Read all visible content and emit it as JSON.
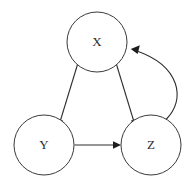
{
  "diagram": {
    "type": "directed-graph",
    "title": "",
    "background_color": "#ffffff",
    "node_stroke_color": "#3a3a3a",
    "edge_color": "#2e2e2e",
    "label_color": "#2b2b2b",
    "nodes": [
      {
        "id": "X",
        "label": "X",
        "cx": 97,
        "cy": 42,
        "r": 30
      },
      {
        "id": "Y",
        "label": "Y",
        "cx": 44,
        "cy": 145,
        "r": 30
      },
      {
        "id": "Z",
        "label": "Z",
        "cx": 151,
        "cy": 145,
        "r": 30
      }
    ],
    "edges": [
      {
        "id": "x-to-y",
        "from": "X",
        "to": "Y",
        "style": "straight",
        "arrow": "end"
      },
      {
        "id": "x-to-z",
        "from": "X",
        "to": "Z",
        "style": "straight",
        "arrow": "end"
      },
      {
        "id": "y-to-z",
        "from": "Y",
        "to": "Z",
        "style": "straight",
        "arrow": "end"
      },
      {
        "id": "z-to-x",
        "from": "Z",
        "to": "X",
        "style": "curved",
        "arrow": "end"
      }
    ]
  }
}
